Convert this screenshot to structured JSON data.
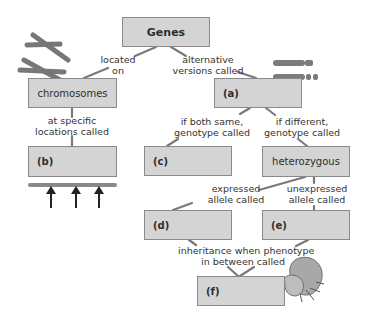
{
  "diagram": {
    "type": "concept-map",
    "nodes": {
      "genes": "Genes",
      "chromosomes": "chromosomes",
      "a": "(a)",
      "b": "(b)",
      "c": "(c)",
      "heterozygous": "heterozygous",
      "d": "(d)",
      "e": "(e)",
      "f": "(f)"
    },
    "links": {
      "located_on": [
        "located",
        "on"
      ],
      "alternative_versions": [
        "alternative",
        "versions called"
      ],
      "specific_locations": [
        "at specific",
        "locations called"
      ],
      "both_same": [
        "if both same,",
        "genotype called"
      ],
      "different": [
        "if different,",
        "genotype called"
      ],
      "expressed": [
        "expressed",
        "allele called"
      ],
      "unexpressed": [
        "unexpressed",
        "allele called"
      ],
      "inheritance": [
        "inheritance when phenotype",
        "in between called"
      ]
    },
    "colors": {
      "box_fill": "#d4d4d4",
      "box_border": "#8a8a8a",
      "connector": "#7a7a7a",
      "chromosome": "#7b7b7b"
    }
  }
}
